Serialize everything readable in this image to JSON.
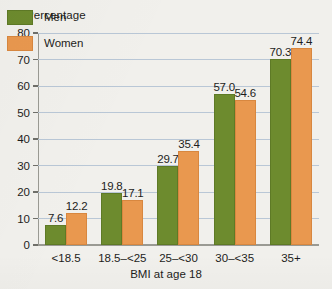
{
  "chart_data": {
    "type": "bar",
    "title": "",
    "ylabel": "Percentage",
    "xlabel": "BMI at age 18",
    "categories": [
      "<18.5",
      "18.5–<25",
      "25–<30",
      "30–<35",
      "35+"
    ],
    "series": [
      {
        "name": "Men",
        "color": "#6d8b2e",
        "values": [
          7.6,
          19.8,
          29.7,
          57.0,
          70.3
        ]
      },
      {
        "name": "Women",
        "color": "#e9984f",
        "values": [
          12.2,
          17.1,
          35.4,
          54.6,
          74.4
        ]
      }
    ],
    "value_labels": {
      "Men": [
        "7.6",
        "19.8",
        "29.7",
        "57.0",
        "70.3"
      ],
      "Women": [
        "12.2",
        "17.1",
        "35.4",
        "54.6",
        "74.4"
      ]
    },
    "ylim": [
      0,
      80
    ],
    "yticks": [
      0,
      10,
      20,
      30,
      40,
      50,
      60,
      70,
      80
    ],
    "ytick_labels": [
      "0",
      "10",
      "20",
      "30",
      "40",
      "50",
      "60",
      "70",
      "80"
    ],
    "grid": true,
    "legend_position": "top-left",
    "legend_entries": [
      "Men",
      "Women"
    ]
  }
}
